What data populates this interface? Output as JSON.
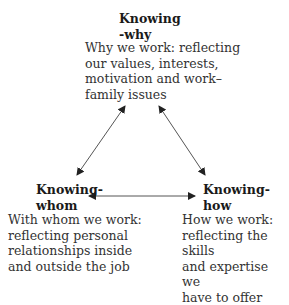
{
  "diagram": {
    "nodes": [
      {
        "id": "why",
        "title_line1": "Knowing",
        "title_line2": "-why",
        "desc": [
          "Why we work: reflecting",
          "our values, interests,",
          "motivation and work–",
          "family issues"
        ]
      },
      {
        "id": "whom",
        "title_line1": "Knowing-",
        "title_line2": "whom",
        "desc": [
          "With whom we work:",
          "reflecting personal",
          "relationships inside",
          "and outside the job"
        ]
      },
      {
        "id": "how",
        "title_line1": "Knowing-",
        "title_line2": "how",
        "desc": [
          "How we work:",
          "reflecting the skills",
          "and expertise we",
          "have to offer"
        ]
      }
    ],
    "edges": [
      {
        "from": "why",
        "to": "whom",
        "bidirectional": true
      },
      {
        "from": "why",
        "to": "how",
        "bidirectional": true
      },
      {
        "from": "whom",
        "to": "how",
        "bidirectional": true
      }
    ],
    "colors": {
      "text": "#2a2a2a",
      "arrow": "#444444"
    }
  }
}
